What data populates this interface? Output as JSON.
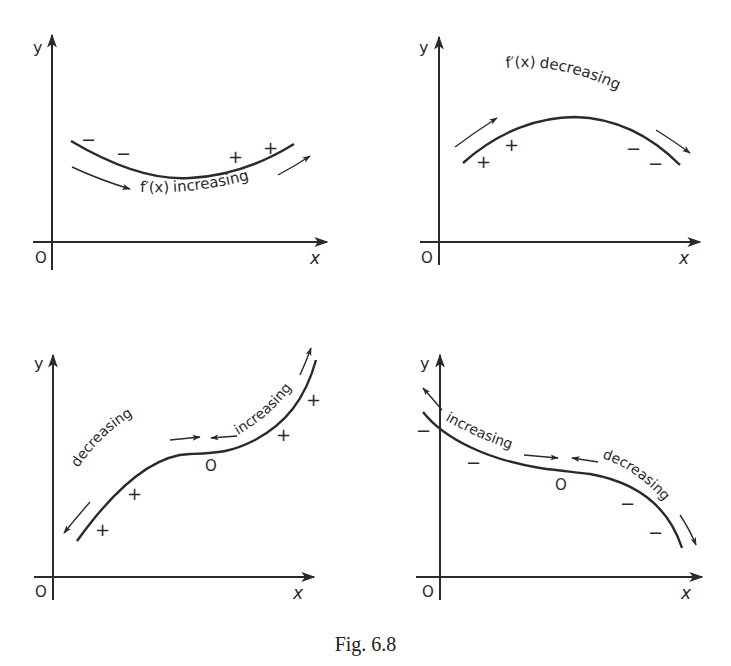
{
  "header": {
    "cropped_text": ""
  },
  "caption": "Fig. 6.8",
  "colors": {
    "ink": "#2a2a2a",
    "background": "#ffffff"
  },
  "panels": [
    {
      "id": "top-left",
      "axis_labels": {
        "y": "y",
        "x": "x",
        "origin": "O"
      },
      "curve": "concave up (minimum)",
      "signs": [
        "−",
        "−",
        "+",
        "+"
      ],
      "annotation": {
        "text_f": "f′(x)",
        "text": "increasing"
      }
    },
    {
      "id": "top-right",
      "axis_labels": {
        "y": "y",
        "x": "x",
        "origin": "O"
      },
      "curve": "concave down (maximum)",
      "signs": [
        "+",
        "+",
        "−",
        "−"
      ],
      "annotation": {
        "text_f": "f′(x)",
        "text": "decreasing"
      }
    },
    {
      "id": "bottom-left",
      "axis_labels": {
        "y": "y",
        "x": "x",
        "origin": "O"
      },
      "curve": "increasing with stationary point of inflexion",
      "signs": [
        "+",
        "+",
        "O",
        "+",
        "+"
      ],
      "annotations": [
        "decreasing",
        "increasing"
      ]
    },
    {
      "id": "bottom-right",
      "axis_labels": {
        "y": "y",
        "x": "x",
        "origin": "O"
      },
      "curve": "decreasing with stationary point of inflexion",
      "signs": [
        "−",
        "−",
        "O",
        "−",
        "−"
      ],
      "annotations": [
        "increasing",
        "decreasing"
      ]
    }
  ]
}
